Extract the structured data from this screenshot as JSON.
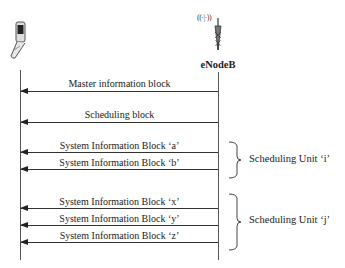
{
  "entities": {
    "ue": {
      "icon": "mobile-phone-icon"
    },
    "enodeb": {
      "label": "eNodeB",
      "icon": "antenna-tower-icon",
      "waves": "((·|·))"
    }
  },
  "messages": [
    {
      "label": "Master information block",
      "direction": "eNodeB->UE"
    },
    {
      "label": "Scheduling block",
      "direction": "eNodeB->UE"
    },
    {
      "label": "System Information Block ‘a’",
      "direction": "eNodeB->UE"
    },
    {
      "label": "System Information Block ‘b’",
      "direction": "eNodeB->UE"
    },
    {
      "label": "System Information Block ‘x’",
      "direction": "eNodeB->UE"
    },
    {
      "label": "System Information Block ‘y’",
      "direction": "eNodeB->UE"
    },
    {
      "label": "System Information Block ‘z’",
      "direction": "eNodeB->UE"
    }
  ],
  "groups": [
    {
      "label": "Scheduling Unit ‘i’",
      "members": [
        "a",
        "b"
      ]
    },
    {
      "label": "Scheduling Unit ‘j’",
      "members": [
        "x",
        "y",
        "z"
      ]
    }
  ]
}
